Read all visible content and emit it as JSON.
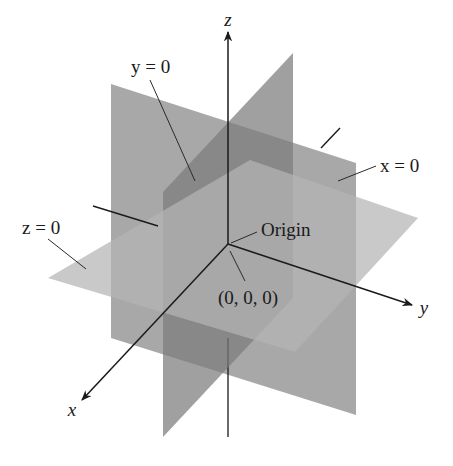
{
  "figure": {
    "axes": {
      "x": {
        "label": "x",
        "tip": [
          82,
          400
        ],
        "label_pos": [
          72,
          414
        ]
      },
      "y": {
        "label": "y",
        "tip": [
          412,
          305
        ],
        "label_pos": [
          422,
          312
        ]
      },
      "z": {
        "label": "z",
        "tip": [
          228,
          32
        ],
        "label_pos": [
          228,
          22
        ]
      }
    },
    "origin_point": [
      228,
      244
    ],
    "planes": [
      {
        "name": "x-equals-0",
        "label": "x = 0",
        "fill": "#8f8f8f",
        "opacity": 0.78,
        "points": "111,84 356,163 356,415 111,338"
      },
      {
        "name": "y-equals-0",
        "label": "y = 0",
        "fill": "#7c7c7c",
        "opacity": 0.72,
        "points": "293,53 163,192 163,437 293,298"
      },
      {
        "name": "z-equals-0",
        "label": "z = 0",
        "fill": "#b4b4b4",
        "opacity": 0.72,
        "points": "48,278 250,160 418,218 295,352"
      }
    ],
    "labels": {
      "y_plane": "y = 0",
      "x_plane": "x = 0",
      "z_plane": "z = 0",
      "origin": "Origin",
      "origin_coords": "(0, 0, 0)"
    },
    "colors": {
      "axis": "#1a1a1a",
      "leader": "#2a2a2a",
      "background": "#ffffff"
    }
  }
}
